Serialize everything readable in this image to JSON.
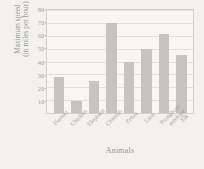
{
  "chart_data": {
    "type": "bar",
    "title": "",
    "xlabel": "Animals",
    "ylabel_line1": "Maximum speed",
    "ylabel_line2": "(in miles per hour)",
    "categories": [
      "Human",
      "Chicken",
      "Elephant",
      "Cheetah",
      "Zebra",
      "Lion",
      "Pronghorn antelope",
      "Elk"
    ],
    "values": [
      28,
      9,
      25,
      70,
      40,
      50,
      61,
      45
    ],
    "ylim": [
      0,
      80
    ],
    "ytick_labels": [
      "10",
      "20",
      "30",
      "40",
      "50",
      "60",
      "70",
      "80"
    ],
    "ytick_values": [
      10,
      20,
      30,
      40,
      50,
      60,
      70,
      80
    ],
    "grid": true,
    "legend": "none",
    "bar_color": "#c6c4c1",
    "plot_background": "#f7f6f4",
    "page_background": "#f2f1ef",
    "axis_color": "#d2d0cd",
    "text_color": "#a09e9b"
  }
}
